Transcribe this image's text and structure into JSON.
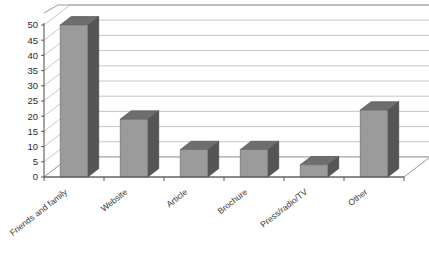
{
  "chart_data": {
    "type": "bar",
    "title": "",
    "subtitle": "",
    "xlabel": "",
    "ylabel": "",
    "categories": [
      "Friends and family",
      "Website",
      "Article",
      "Brochure",
      "Press/radio/TV",
      "Other"
    ],
    "values": [
      50,
      19,
      9,
      9,
      4,
      22
    ],
    "series": [
      {
        "name": "Responses",
        "values": [
          50,
          19,
          9,
          9,
          4,
          22
        ]
      }
    ],
    "ylim": [
      0,
      50
    ],
    "ytick_step": 5,
    "yticks": [
      "0",
      "5",
      "10",
      "15",
      "20",
      "25",
      "30",
      "35",
      "40",
      "45",
      "50"
    ],
    "grid": true,
    "legend": "none",
    "style": "3d-column",
    "colors": {
      "bar_front": "#9b9b9b",
      "bar_side": "#555555",
      "bar_top": "#6e6e6e",
      "gridline": "#b9b9b9",
      "axis": "#4a4a4a",
      "background": "#ffffff",
      "text": "#2b2b2b"
    },
    "xlabel_rotation": -38
  }
}
